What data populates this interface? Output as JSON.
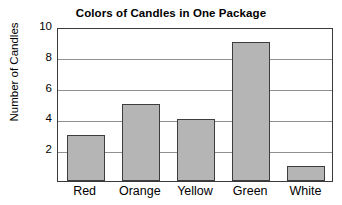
{
  "chart_data": {
    "type": "bar",
    "title": "Colors of Candles in One Package",
    "xlabel": "",
    "ylabel": "Number of Candles",
    "categories": [
      "Red",
      "Orange",
      "Yellow",
      "Green",
      "White"
    ],
    "values": [
      3,
      5,
      4,
      9,
      1
    ],
    "ylim": [
      0,
      10
    ],
    "yticks": [
      2,
      4,
      6,
      8,
      10
    ],
    "ytick_labels": [
      "2",
      "4",
      "6",
      "8",
      "10"
    ],
    "grid": true,
    "gridlines_at": [
      2,
      4,
      6,
      8
    ],
    "legend": null,
    "legend_position": "none",
    "series": [
      {
        "name": "Number of Candles",
        "values": [
          3,
          5,
          4,
          9,
          1
        ],
        "bar_color": "#b5b5b5",
        "bar_edge_color": "#3d3d3d"
      }
    ],
    "colors": {
      "background": "#ffffff",
      "axis": "#3a3a3a",
      "gridline": "#8f8f8f",
      "text": "#000000",
      "bar_fill": "#b5b5b5",
      "bar_edge": "#3d3d3d"
    }
  }
}
